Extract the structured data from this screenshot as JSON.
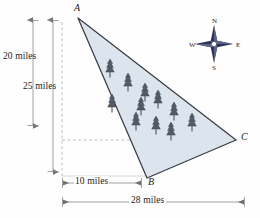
{
  "figure": {
    "type": "geometry-diagram",
    "fill_color": "#dce5ee",
    "outline_color": "#3b3b45",
    "tree_color": "#4a5260",
    "dimension_color": "#8a8a8a",
    "dashed_color": "#9aa7b5"
  },
  "vertices": [
    {
      "id": "A",
      "label": "A",
      "x": 78,
      "y": 12
    },
    {
      "id": "B",
      "label": "B",
      "x": 147,
      "y": 180
    },
    {
      "id": "C",
      "label": "C",
      "x": 238,
      "y": 140
    }
  ],
  "dimensions": [
    {
      "id": "d20",
      "label": "20 miles",
      "value": 20,
      "unit": "miles",
      "orientation": "vertical"
    },
    {
      "id": "d25",
      "label": "25 miles",
      "value": 25,
      "unit": "miles",
      "orientation": "vertical"
    },
    {
      "id": "d10",
      "label": "10 miles",
      "value": 10,
      "unit": "miles",
      "orientation": "horizontal"
    },
    {
      "id": "d28",
      "label": "28 miles",
      "value": 28,
      "unit": "miles",
      "orientation": "horizontal"
    }
  ],
  "compass": {
    "name": "compass-rose",
    "north": "N",
    "east": "E",
    "south": "S",
    "west": "W",
    "color_dark": "#2b3356",
    "color_light": "#aeb6cd"
  },
  "trees": {
    "count": 11,
    "symbol": "pine-tree",
    "positions": [
      [
        110,
        70
      ],
      [
        128,
        83
      ],
      [
        143,
        92
      ],
      [
        113,
        104
      ],
      [
        140,
        106
      ],
      [
        155,
        99
      ],
      [
        137,
        120
      ],
      [
        155,
        124
      ],
      [
        172,
        112
      ],
      [
        170,
        130
      ],
      [
        190,
        122
      ]
    ]
  }
}
